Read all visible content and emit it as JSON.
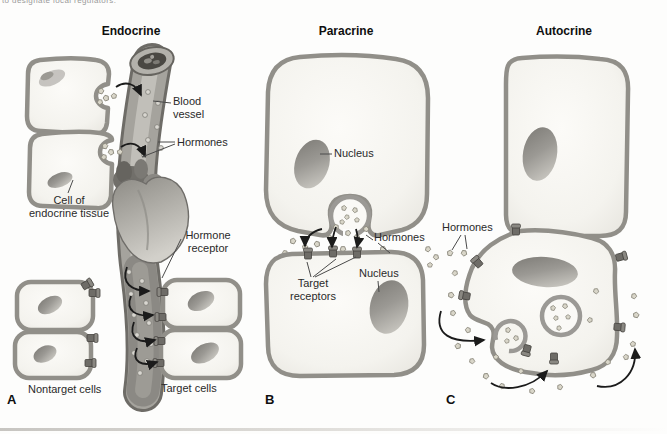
{
  "page": {
    "top_text_fragment": "to designate local regulators.",
    "figure_caption": ""
  },
  "panels": {
    "endocrine": {
      "title": "Endocrine",
      "letter": "A",
      "labels": {
        "blood_vessel": [
          "Blood",
          "vessel"
        ],
        "hormones": "Hormones",
        "cell_of_endocrine_tissue": [
          "Cell of",
          "endocrine tissue"
        ],
        "hormone_receptor": [
          "Hormone",
          "receptor"
        ],
        "nontarget_cells": "Nontarget cells",
        "target_cells": "Target cells"
      }
    },
    "paracrine": {
      "title": "Paracrine",
      "letter": "B",
      "labels": {
        "nucleus_top": "Nucleus",
        "hormones": "Hormones",
        "target_receptors": [
          "Target",
          "receptors"
        ],
        "nucleus_bottom": "Nucleus"
      }
    },
    "autocrine": {
      "title": "Autocrine",
      "letter": "C",
      "labels": {
        "hormones": "Hormones"
      }
    }
  }
}
